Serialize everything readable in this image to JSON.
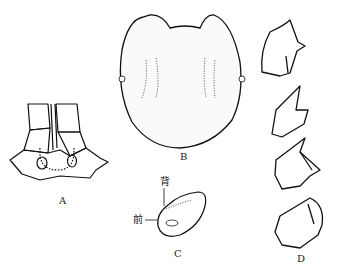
{
  "figure": {
    "panels": [
      {
        "id": "A",
        "label": "A",
        "description": "ventral view of head with antennae bases"
      },
      {
        "id": "B",
        "label": "B",
        "description": "stippled rounded carapace / body, dorsal view"
      },
      {
        "id": "C",
        "label": "C",
        "description": "oval structure with orientation labels",
        "annotations": {
          "dorsal": "背",
          "anterior": "前"
        }
      },
      {
        "id": "D",
        "label": "D",
        "description": "series of four claw / segment outlines"
      }
    ]
  }
}
